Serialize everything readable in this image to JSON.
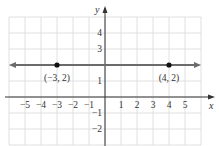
{
  "chart_data": {
    "type": "line",
    "title": "",
    "xlabel": "x",
    "ylabel": "y",
    "xlim": [
      -6,
      6
    ],
    "ylim": [
      -3,
      5
    ],
    "grid": true,
    "x_ticks": [
      -5,
      -4,
      -3,
      -2,
      -1,
      1,
      2,
      3,
      4,
      5
    ],
    "x_tick_labels": [
      "−5",
      "−4",
      "−3",
      "−2",
      "−1",
      "1",
      "2",
      "3",
      "4",
      "5"
    ],
    "y_ticks": [
      4,
      3,
      1,
      -1,
      -2
    ],
    "y_tick_labels": [
      "4",
      "3",
      "1",
      "−1",
      "−2"
    ],
    "series": [
      {
        "name": "y = 2",
        "kind": "horizontal line with arrows",
        "y": 2,
        "color": "#6b6b6b"
      }
    ],
    "points": [
      {
        "x": -3,
        "y": 2,
        "label": "(−3, 2)"
      },
      {
        "x": 4,
        "y": 2,
        "label": "(4, 2)"
      }
    ]
  },
  "style": {
    "grid_color": "#d8d8d8",
    "axis_color": "#333333",
    "line_color": "#6b6b6b",
    "point_color": "#111111"
  }
}
